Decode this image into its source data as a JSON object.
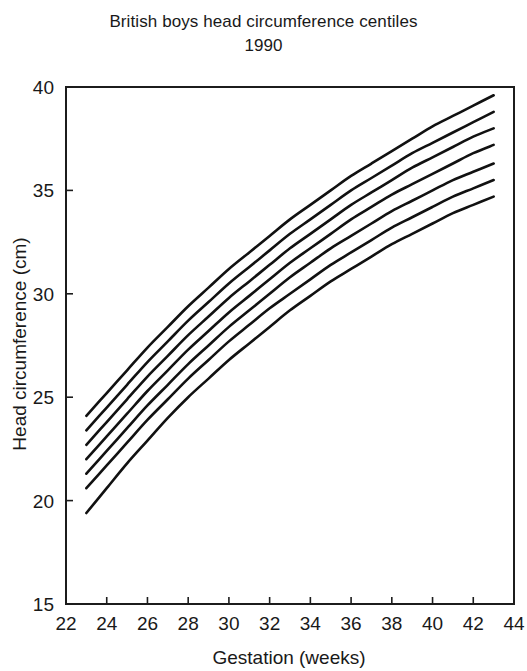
{
  "chart_data": {
    "type": "line",
    "title": "British boys head circumference centiles",
    "subtitle": "1990",
    "xlabel": "Gestation (weeks)",
    "ylabel": "Head circumference (cm)",
    "xlim": [
      22,
      44
    ],
    "ylim": [
      15,
      40
    ],
    "xticks": [
      22,
      24,
      26,
      28,
      30,
      32,
      34,
      36,
      38,
      40,
      42,
      44
    ],
    "yticks": [
      15,
      20,
      25,
      30,
      35,
      40
    ],
    "xtick_labels": [
      "22",
      "24",
      "26",
      "28",
      "30",
      "32",
      "34",
      "36",
      "38",
      "40",
      "42",
      "44"
    ],
    "ytick_labels": [
      "15",
      "20",
      "25",
      "30",
      "35",
      "40"
    ],
    "grid": false,
    "legend": "none",
    "line_color": "#111111",
    "background_color": "#ffffff",
    "x": [
      23,
      24,
      25,
      26,
      27,
      28,
      29,
      30,
      31,
      32,
      33,
      34,
      35,
      36,
      37,
      38,
      39,
      40,
      41,
      42,
      43
    ],
    "series": [
      {
        "name": "98th centile",
        "values": [
          24.1,
          25.2,
          26.3,
          27.4,
          28.4,
          29.4,
          30.3,
          31.2,
          32.0,
          32.8,
          33.6,
          34.3,
          35.0,
          35.7,
          36.3,
          36.9,
          37.5,
          38.1,
          38.6,
          39.1,
          39.6
        ]
      },
      {
        "name": "91st centile",
        "values": [
          23.4,
          24.5,
          25.6,
          26.7,
          27.7,
          28.7,
          29.6,
          30.5,
          31.3,
          32.1,
          32.9,
          33.6,
          34.3,
          35.0,
          35.6,
          36.2,
          36.8,
          37.3,
          37.8,
          38.3,
          38.8
        ]
      },
      {
        "name": "75th centile",
        "values": [
          22.7,
          23.8,
          24.9,
          26.0,
          27.0,
          28.0,
          28.9,
          29.8,
          30.6,
          31.4,
          32.2,
          32.9,
          33.6,
          34.3,
          34.9,
          35.5,
          36.1,
          36.6,
          37.1,
          37.6,
          38.0
        ]
      },
      {
        "name": "50th centile",
        "values": [
          22.0,
          23.1,
          24.2,
          25.3,
          26.3,
          27.3,
          28.2,
          29.1,
          29.9,
          30.7,
          31.5,
          32.2,
          32.9,
          33.6,
          34.2,
          34.8,
          35.3,
          35.8,
          36.3,
          36.8,
          37.2
        ]
      },
      {
        "name": "25th centile",
        "values": [
          21.3,
          22.4,
          23.5,
          24.6,
          25.6,
          26.6,
          27.5,
          28.4,
          29.2,
          30.0,
          30.8,
          31.5,
          32.2,
          32.8,
          33.4,
          34.0,
          34.5,
          35.0,
          35.5,
          35.9,
          36.3
        ]
      },
      {
        "name": "9th centile",
        "values": [
          20.6,
          21.7,
          22.8,
          23.9,
          24.9,
          25.9,
          26.8,
          27.7,
          28.5,
          29.3,
          30.0,
          30.7,
          31.4,
          32.0,
          32.6,
          33.2,
          33.7,
          34.2,
          34.7,
          35.1,
          35.5
        ]
      },
      {
        "name": "2nd centile",
        "values": [
          19.4,
          20.6,
          21.8,
          22.9,
          24.0,
          25.0,
          25.9,
          26.8,
          27.6,
          28.4,
          29.2,
          29.9,
          30.6,
          31.2,
          31.8,
          32.4,
          32.9,
          33.4,
          33.9,
          34.3,
          34.7
        ]
      }
    ]
  },
  "chart": {
    "title": "British boys head circumference centiles",
    "subtitle": "1990",
    "xlabel": "Gestation (weeks)",
    "ylabel": "Head circumference (cm)"
  }
}
